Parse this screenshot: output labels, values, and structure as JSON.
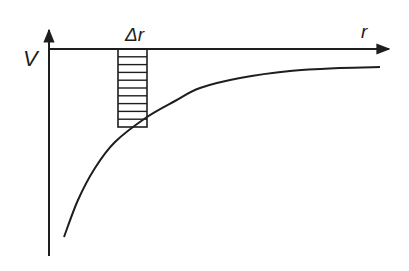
{
  "diagram": {
    "labels": {
      "y_axis": "V",
      "x_axis": "r",
      "strip": "Δr"
    },
    "colors": {
      "ink": "#1e1e1e",
      "background": "#ffffff"
    },
    "strip": {
      "x_left": 118,
      "x_right": 147,
      "y_top": 49,
      "y_bottom": 127,
      "hatch_lines": 10
    },
    "curve_points": [
      [
        64,
        237
      ],
      [
        78,
        200
      ],
      [
        95,
        168
      ],
      [
        115,
        142
      ],
      [
        147,
        117
      ],
      [
        175,
        101
      ],
      [
        200,
        88
      ],
      [
        240,
        78
      ],
      [
        290,
        71
      ],
      [
        340,
        68
      ],
      [
        380,
        67
      ]
    ]
  }
}
